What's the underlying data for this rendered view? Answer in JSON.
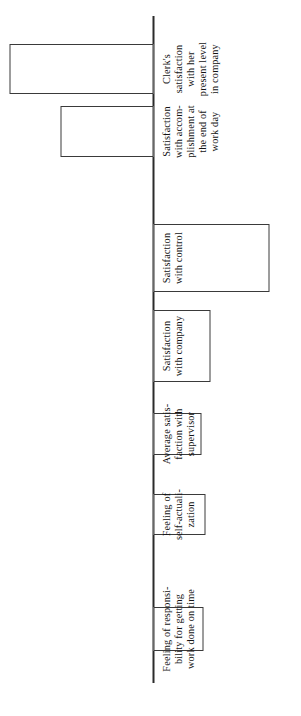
{
  "chart_data": {
    "type": "bar",
    "orientation": "vertical-bars-rotated-90",
    "title": "",
    "subtitle": "",
    "xlabel": "",
    "ylabel": "",
    "grid": false,
    "legend": null,
    "baseline": 0,
    "axis_note": "Single unlabeled baseline axis; bars extend above (positive) or below (negative) the baseline. No numeric tick labels are printed on the figure.",
    "categories": [
      "Feeling of responsi-\nbility for getting\nwork done on time",
      "Feeling of\nself-actuali-\nzation",
      "Average satis-\nfaction with\nsupervisor",
      "Satisfaction\nwith company",
      "Satisfaction\nwith control",
      "Satisfaction\nwith accom-\nplishment at\nthe end of\nwork day",
      "Clerk's\nsatisfaction\nwith her\npresent level\nin company"
    ],
    "categories_flat": [
      "Feeling of responsibility for getting work done on time",
      "Feeling of self-actualization",
      "Average satisfaction with supervisor",
      "Satisfaction with company",
      "Satisfaction with control",
      "Satisfaction with accomplishment at the end of work day",
      "Clerk's satisfaction with her present level in company"
    ],
    "values": [
      -50,
      -52,
      -48,
      -57,
      -116,
      93,
      144
    ],
    "value_units": "pixels of bar length from baseline (no numeric scale printed)",
    "series": [
      {
        "name": "Change in satisfaction measure",
        "values": [
          -50,
          -52,
          -48,
          -57,
          -116,
          93,
          144
        ]
      }
    ],
    "ylim": [
      -120,
      150
    ]
  },
  "figure": {
    "background_color": "#ffffff",
    "bar_fill_color": "#ffffff",
    "bar_stroke_color": "#3a3a3a",
    "axis_color": "#2b2b2b",
    "text_color": "#141414"
  }
}
